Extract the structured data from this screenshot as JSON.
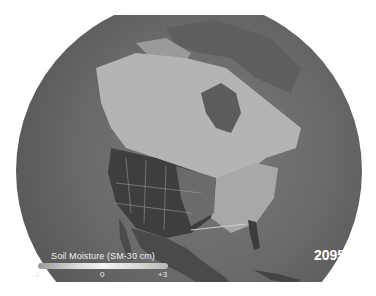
{
  "map": {
    "subject": "North America soil moisture projection",
    "projection": "orthographic globe",
    "colors": {
      "ocean": "#6a6a6a",
      "land_wet": "#bdbdbd",
      "land_dry": "#3a3a3a",
      "background": "#ffffff"
    }
  },
  "legend": {
    "title": "Soil Moisture (SM-30 cm)",
    "min_label": "-3",
    "mid_label": "0",
    "max_label": "+3"
  },
  "year_label": "2095"
}
